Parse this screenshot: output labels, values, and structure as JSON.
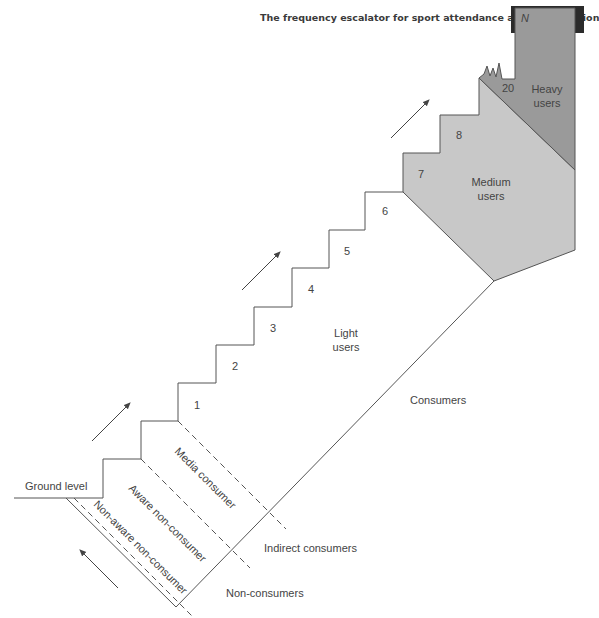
{
  "header": {
    "title": "The frequency escalator for sport attendance and participation",
    "figure_label": "FIGURE 9.2"
  },
  "diagram": {
    "steps": [
      "1",
      "2",
      "3",
      "4",
      "5",
      "6",
      "7",
      "8",
      "20",
      "N"
    ],
    "ground_label": "Ground level",
    "segments": {
      "light": "Light users",
      "light_line1": "Light",
      "light_line2": "users",
      "medium_line1": "Medium",
      "medium_line2": "users",
      "heavy_line1": "Heavy",
      "heavy_line2": "users"
    },
    "non_consumer_bands": {
      "media": "Media consumer",
      "aware": "Aware non-consumer",
      "non_aware": "Non-aware non-consumer"
    },
    "groups": {
      "consumers": "Consumers",
      "indirect": "Indirect consumers",
      "non_consumers": "Non-consumers"
    },
    "colors": {
      "medium_fill": "#c8c8c8",
      "heavy_fill": "#9a9a9a",
      "line": "#555555",
      "badge_bg": "#2b2b2b"
    }
  }
}
